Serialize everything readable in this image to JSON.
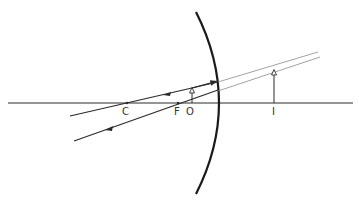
{
  "diagram": {
    "type": "convex-mirror-ray-diagram",
    "labels": {
      "center_of_curvature": "C",
      "focal_point": "F",
      "object": "O",
      "image": "I"
    },
    "colors": {
      "line": "#2a2a2a",
      "construction": "#8a8a8a",
      "mirror": "#1a1a1a",
      "background": "#ffffff"
    }
  }
}
